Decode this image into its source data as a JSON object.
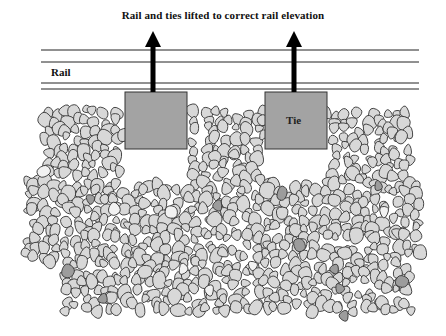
{
  "diagram": {
    "title": "Rail and ties lifted to correct rail elevation",
    "labels": {
      "rail": "Rail",
      "tie": "Tie"
    },
    "colors": {
      "line": "#222222",
      "tie_fill": "#a3a3a3",
      "tie_stroke": "#333333",
      "stone_fill": "#d8d8d8",
      "stone_dark": "#9c9c9c",
      "stone_light": "#f1f1f1",
      "stone_stroke": "#333333",
      "arrow": "#000000"
    },
    "rail_lines_y": [
      50,
      62,
      83,
      89
    ],
    "rail_x_range": [
      41,
      419
    ],
    "ties": [
      {
        "id": "left-tie",
        "x": 125,
        "y": 92,
        "w": 62,
        "h": 57,
        "label": ""
      },
      {
        "id": "right-tie",
        "x": 265,
        "y": 92,
        "w": 62,
        "h": 57,
        "label": "Tie"
      }
    ],
    "arrows": [
      {
        "id": "left-lift-arrow",
        "x": 153,
        "top": 31,
        "bottom": 92
      },
      {
        "id": "right-lift-arrow",
        "x": 294,
        "top": 31,
        "bottom": 92
      }
    ],
    "ballast": {
      "description": "Crushed stone ballast bed with voids beneath lifted ties",
      "regions": [
        {
          "x0": 44,
          "x1": 125,
          "y0": 110,
          "y1": 175
        },
        {
          "x0": 187,
          "x1": 265,
          "y0": 110,
          "y1": 175
        },
        {
          "x0": 327,
          "x1": 410,
          "y0": 110,
          "y1": 175
        },
        {
          "x0": 25,
          "x1": 425,
          "y0": 175,
          "y1": 265
        },
        {
          "x0": 60,
          "x1": 410,
          "y0": 260,
          "y1": 312
        }
      ],
      "voids": [
        {
          "x0": 125,
          "x1": 187,
          "y0": 149,
          "y1": 183
        },
        {
          "x0": 265,
          "x1": 327,
          "y0": 149,
          "y1": 183
        }
      ],
      "dark_stones": [
        [
          90,
          199
        ],
        [
          218,
          205
        ],
        [
          282,
          193
        ],
        [
          378,
          186
        ],
        [
          299,
          245
        ],
        [
          68,
          271
        ],
        [
          334,
          270
        ],
        [
          340,
          288
        ],
        [
          102,
          299
        ],
        [
          402,
          282
        ],
        [
          343,
          316
        ]
      ],
      "light_stones": [
        [
          44,
          171
        ],
        [
          115,
          209
        ],
        [
          171,
          212
        ],
        [
          384,
          212
        ],
        [
          183,
          269
        ],
        [
          252,
          266
        ],
        [
          210,
          290
        ]
      ]
    }
  }
}
